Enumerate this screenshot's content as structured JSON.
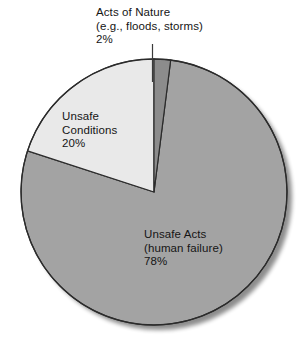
{
  "chart_data": {
    "type": "pie",
    "title": "",
    "subtitle": "",
    "xlabel": "",
    "ylabel": "",
    "legend_position": "none",
    "grid": false,
    "units": "percent",
    "total": 100,
    "categories": [
      "Unsafe Acts (human failure)",
      "Unsafe Conditions",
      "Acts of Nature (e.g., floods, storms)"
    ],
    "values": [
      78,
      20,
      2
    ],
    "slices": [
      {
        "name": "unsafe-acts",
        "label_lines": [
          "Unsafe Acts",
          "(human failure)",
          "78%"
        ],
        "label_text": "Unsafe Acts (human failure)",
        "value": 78,
        "value_label": "78%",
        "color": "#a3a3a3",
        "start_angle_deg": 7.2,
        "end_angle_deg": 288.0,
        "label_placement": "inside"
      },
      {
        "name": "unsafe-conditions",
        "label_lines": [
          "Unsafe",
          "Conditions",
          "20%"
        ],
        "label_text": "Unsafe Conditions",
        "value": 20,
        "value_label": "20%",
        "color": "#e9e9e9",
        "start_angle_deg": 288.0,
        "end_angle_deg": 360.0,
        "label_placement": "inside"
      },
      {
        "name": "acts-of-nature",
        "label_lines": [
          "Acts of Nature",
          "(e.g., floods, storms)",
          "2%"
        ],
        "label_text": "Acts of Nature (e.g., floods, storms)",
        "value": 2,
        "value_label": "2%",
        "color": "#8c8c8c",
        "start_angle_deg": 0.0,
        "end_angle_deg": 7.2,
        "label_placement": "outside-leader"
      }
    ],
    "colors": {
      "unsafe_acts": "#a3a3a3",
      "unsafe_conditions": "#e9e9e9",
      "acts_of_nature": "#8c8c8c",
      "outline": "#2b2b2b",
      "leader_line": "#3a3a3a",
      "background": "#ffffff",
      "shadow": "#bfbfbf"
    }
  },
  "labels": {
    "acts_of_nature": {
      "line1": "Acts of Nature",
      "line2": "(e.g., floods, storms)",
      "line3": "2%"
    },
    "unsafe_conditions": {
      "line1": "Unsafe",
      "line2": "Conditions",
      "line3": "20%"
    },
    "unsafe_acts": {
      "line1": "Unsafe Acts",
      "line2": "(human failure)",
      "line3": "78%"
    }
  },
  "icons": {
    "leader_line": "leader-line",
    "pie": "pie-chart-icon"
  }
}
